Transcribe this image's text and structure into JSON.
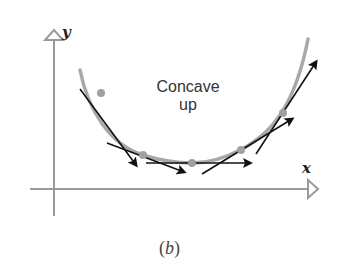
{
  "figure": {
    "caption_open": "(",
    "caption_letter": "b",
    "caption_close": ")",
    "annotation_line1": "Concave",
    "annotation_line2": "up",
    "x_axis_label": "x",
    "y_axis_label": "y"
  },
  "colors": {
    "axis": "#9a9a9a",
    "curve": "#a8a8a8",
    "tangent": "#111111",
    "point": "#a0a0a0",
    "text": "#333333"
  },
  "diagram": {
    "type": "concave-up curve with tangent vectors",
    "points": [
      {
        "label": "P1",
        "slope": "steep negative"
      },
      {
        "label": "P2",
        "slope": "negative"
      },
      {
        "label": "P3",
        "slope": "zero"
      },
      {
        "label": "P4",
        "slope": "positive"
      },
      {
        "label": "P5",
        "slope": "steep positive"
      }
    ]
  }
}
